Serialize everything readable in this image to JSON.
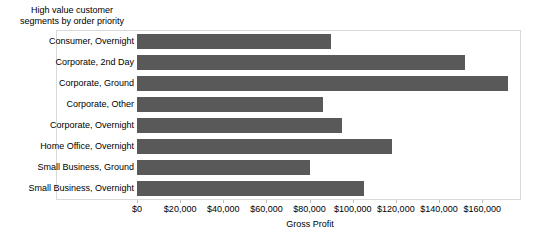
{
  "chart_data": {
    "type": "bar",
    "orientation": "horizontal",
    "title": "High value customer\nsegments by order priority",
    "xlabel": "Gross Profit",
    "ylabel": "",
    "categories": [
      "Consumer, Overnight",
      "Corporate, 2nd Day",
      "Corporate, Ground",
      "Corporate, Other",
      "Corporate, Overnight",
      "Home Office, Overnight",
      "Small Business, Ground",
      "Small Business, Overnight"
    ],
    "values": [
      90000,
      152000,
      172000,
      86000,
      95000,
      118000,
      80000,
      105000
    ],
    "xlim": [
      0,
      178000
    ],
    "xticks": [
      0,
      20000,
      40000,
      60000,
      80000,
      100000,
      120000,
      140000,
      160000
    ],
    "xtick_labels": [
      "$0",
      "$20,000",
      "$40,000",
      "$60,000",
      "$80,000",
      "$100,000",
      "$120,000",
      "$140,000",
      "$160,000"
    ],
    "grid": false,
    "legend": "none",
    "bar_color": "#595959",
    "frame_color": "#d9d9d9",
    "background": "#ffffff"
  }
}
